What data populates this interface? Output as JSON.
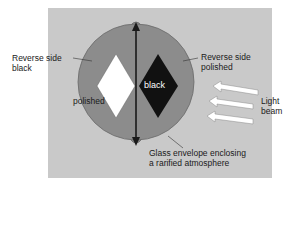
{
  "diagram": {
    "labels": {
      "reverse_black": "Reverse side\nblack",
      "reverse_polished": "Reverse side\npolished",
      "polished": "polished",
      "black": "black",
      "light_beam": "Light\nbeam",
      "glass_envelope": "Glass envelope enclosing\na rarified atmosphere"
    },
    "colors": {
      "panel": "#c9c9c9",
      "envelope": "#8c8c8c",
      "envelope_edge": "#6a6a6a",
      "vane_polished": "#ffffff",
      "vane_black": "#111111",
      "axis": "#1a1a1a",
      "arrow_fill": "#ffffff"
    },
    "light_arrows": 3
  }
}
